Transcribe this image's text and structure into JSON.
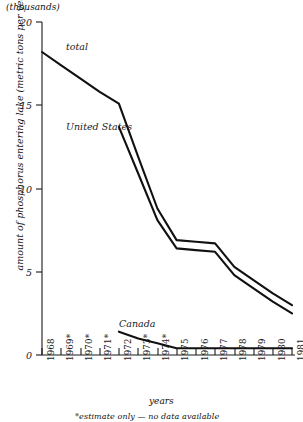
{
  "units_note": "(thousands)",
  "axes": {
    "ylabel": "amount of phosphorus entering lake (metric tons per year)",
    "xlabel": "years",
    "yticks": [
      "0",
      "5",
      "10",
      "15",
      "20"
    ],
    "xticks": [
      "1968",
      "1969*",
      "1970*",
      "1971*",
      "1972",
      "1973*",
      "1974*",
      "1975",
      "1976",
      "1977",
      "1978",
      "1979",
      "1980",
      "1981"
    ]
  },
  "labels": {
    "total": "total",
    "united_states": "United States",
    "canada": "Canada"
  },
  "footnote": "*estimate only — no data available",
  "chart_data": {
    "type": "line",
    "title": "",
    "subtitle": "(thousands)",
    "xlabel": "years",
    "ylabel": "amount of phosphorus entering lake (metric tons per year)",
    "xlim": [
      1968,
      1981
    ],
    "ylim": [
      0,
      20
    ],
    "yticks": [
      0,
      5,
      10,
      15,
      20
    ],
    "grid": false,
    "legend": "inline-annotations",
    "x": [
      1968,
      1969,
      1970,
      1971,
      1972,
      1973,
      1974,
      1975,
      1976,
      1977,
      1978,
      1979,
      1980,
      1981
    ],
    "series": [
      {
        "name": "total",
        "values": [
          18.2,
          17.4,
          16.6,
          15.8,
          15.1,
          11.9,
          8.8,
          6.9,
          6.8,
          6.7,
          5.3,
          4.5,
          3.7,
          3.0
        ]
      },
      {
        "name": "United States",
        "values": [
          null,
          null,
          null,
          null,
          13.7,
          10.9,
          8.1,
          6.4,
          6.3,
          6.2,
          4.8,
          4.0,
          3.2,
          2.5
        ]
      },
      {
        "name": "Canada",
        "values": [
          null,
          null,
          null,
          null,
          1.4,
          1.0,
          0.7,
          0.4,
          0.4,
          0.4,
          0.4,
          0.4,
          0.4,
          0.4
        ]
      }
    ],
    "annotations": [
      {
        "text": "total",
        "x": 1969.6,
        "y": 18.9
      },
      {
        "text": "United States",
        "x": 1969.6,
        "y": 14.2
      },
      {
        "text": "Canada",
        "x": 1972.1,
        "y": 2.2
      },
      {
        "text": "*estimate only — no data available",
        "x": 1969.5,
        "y": -3.9
      }
    ],
    "estimated_years": [
      1969,
      1970,
      1971,
      1973,
      1974
    ]
  }
}
